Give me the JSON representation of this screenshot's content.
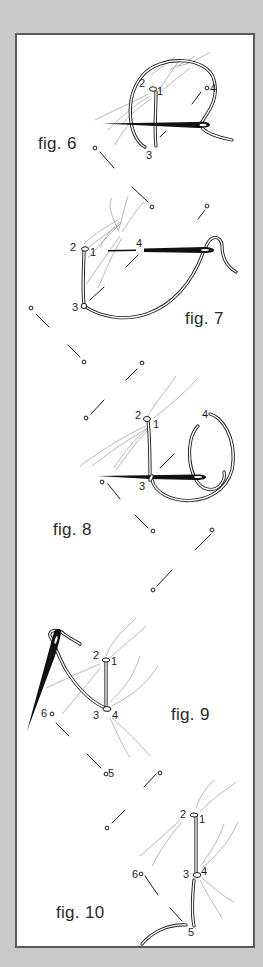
{
  "figures": [
    {
      "id": "fig6",
      "label": "fig. 6",
      "points": [
        "1",
        "2",
        "3",
        "4"
      ]
    },
    {
      "id": "fig7",
      "label": "fig. 7",
      "points": [
        "1",
        "2",
        "3",
        "4"
      ]
    },
    {
      "id": "fig8",
      "label": "fig. 8",
      "points": [
        "1",
        "2",
        "3",
        "4"
      ]
    },
    {
      "id": "fig9",
      "label": "fig. 9",
      "points": [
        "1",
        "2",
        "3",
        "4",
        "5",
        "6"
      ]
    },
    {
      "id": "fig10",
      "label": "fig. 10",
      "points": [
        "1",
        "2",
        "3",
        "4",
        "5",
        "6"
      ]
    }
  ],
  "colors": {
    "background": "#c9c9c9",
    "frame_border": "#5a5a5a",
    "paper": "#ffffff",
    "ink": "#1a1a1a",
    "fibre": "#8a8a8a"
  }
}
